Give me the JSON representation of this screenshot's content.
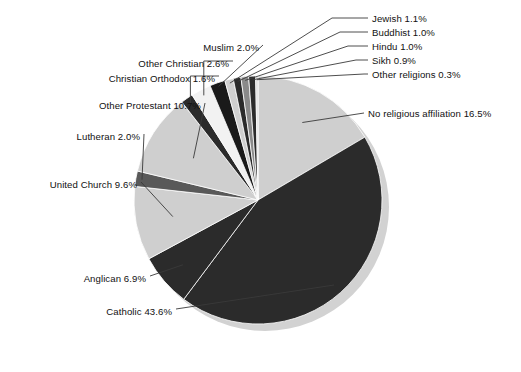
{
  "chart_data": {
    "type": "pie",
    "title": "",
    "subtitle": "",
    "xlabel": "",
    "ylabel": "",
    "legend_position": "none",
    "grid": false,
    "units": "percent",
    "start_angle_deg": 0,
    "direction": "clockwise",
    "categories": [
      "No religious affiliation",
      "Catholic",
      "Anglican",
      "United Church",
      "Lutheran",
      "Other Protestant",
      "Christian Orthodox",
      "Other Christian",
      "Muslim",
      "Jewish",
      "Buddhist",
      "Hindu",
      "Sikh",
      "Other religions"
    ],
    "values": [
      16.5,
      43.6,
      6.9,
      9.6,
      2.0,
      10.7,
      1.6,
      2.6,
      2.0,
      1.1,
      1.0,
      1.0,
      0.9,
      0.3
    ],
    "labels": [
      "No religious affiliation 16.5%",
      "Catholic 43.6%",
      "Anglican 6.9%",
      "United Church 9.6%",
      "Lutheran 2.0%",
      "Other Protestant 10.7%",
      "Christian Orthodox 1.6%",
      "Other Christian 2.6%",
      "Muslim 2.0%",
      "Jewish 1.1%",
      "Buddhist 1.0%",
      "Hindu 1.0%",
      "Sikh 0.9%",
      "Other religions 0.3%"
    ],
    "slice_colors": [
      "#cfcfcf",
      "#2b2b2b",
      "#2b2b2b",
      "#cfcfcf",
      "#595959",
      "#cfcfcf",
      "#2b2b2b",
      "#f2f2f2",
      "#1a1a1a",
      "#cfcfcf",
      "#2b2b2b",
      "#8a8a8a",
      "#2b2b2b",
      "#d8d8d8"
    ]
  },
  "colors": {
    "background": "#ffffff",
    "text": "#111111",
    "leader_line": "#3a3a3a",
    "slice_outline": "#ffffff",
    "shadow": "#d2d2d2"
  },
  "geometry": {
    "center_x": 258,
    "center_y": 200,
    "radius": 124,
    "shadow_offset_x": 7,
    "shadow_offset_y": 7
  },
  "labels_right": [
    {
      "text": "Jewish 1.1%",
      "x": 372,
      "y": 13
    },
    {
      "text": "Buddhist 1.0%",
      "x": 372,
      "y": 27
    },
    {
      "text": "Hindu 1.0%",
      "x": 372,
      "y": 41
    },
    {
      "text": "Sikh 0.9%",
      "x": 372,
      "y": 55
    },
    {
      "text": "Other religions 0.3%",
      "x": 372,
      "y": 69
    },
    {
      "text": "No religious affiliation 16.5%",
      "x": 368,
      "y": 108
    }
  ],
  "labels_left": [
    {
      "text": "Muslim 2.0%",
      "right": 259,
      "y": 42
    },
    {
      "text": "Other Christian 2.6%",
      "right": 229,
      "y": 58
    },
    {
      "text": "Christian Orthodox 1.6%",
      "right": 215,
      "y": 73
    },
    {
      "text": "Other Protestant 10.7%",
      "right": 201,
      "y": 100
    },
    {
      "text": "Lutheran 2.0%",
      "right": 140,
      "y": 131
    },
    {
      "text": "United Church 9.6%",
      "right": 137,
      "y": 179
    },
    {
      "text": "Anglican 6.9%",
      "right": 146,
      "y": 273
    },
    {
      "text": "Catholic 43.6%",
      "right": 172,
      "y": 306
    }
  ]
}
